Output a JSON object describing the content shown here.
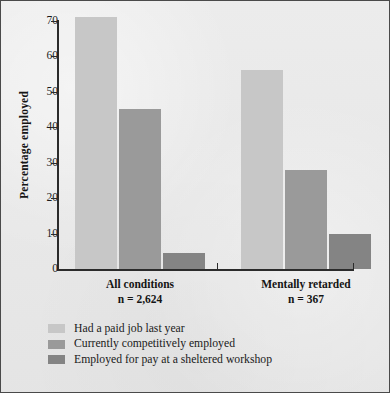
{
  "chart_data": {
    "type": "bar",
    "title": "",
    "subtitle": "",
    "xlabel": "",
    "ylabel": "Percentage employed",
    "ylim": [
      0,
      70
    ],
    "ytick_step": 10,
    "yticks": [
      70,
      60,
      50,
      40,
      30,
      20,
      10,
      0
    ],
    "ytick_labels": [
      "70",
      "60",
      "50",
      "40",
      "30",
      "20",
      "10",
      "0"
    ],
    "grid": false,
    "legend_position": "below-axis-left",
    "categories": [
      "All conditions",
      "Mentally retarded"
    ],
    "category_sublabels": [
      "n = 2,624",
      "n = 367"
    ],
    "series": [
      {
        "name": "Had a paid job last year",
        "color": "#c7c7c7",
        "values": [
          71,
          56
        ]
      },
      {
        "name": "Currently competitively employed",
        "color": "#9a9a9a",
        "values": [
          45,
          28
        ]
      },
      {
        "name": "Employed for pay at a sheltered workshop",
        "color": "#848484",
        "values": [
          4.5,
          10
        ]
      }
    ],
    "colors": {
      "background": "#e9e9e9",
      "axis": "#2b2b2b",
      "text": "#151515",
      "frame": "#4a4a4a"
    }
  }
}
